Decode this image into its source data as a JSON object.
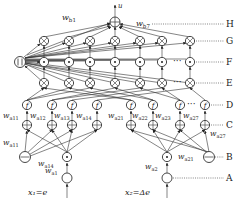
{
  "diagram": {
    "output_label": "u",
    "input_labels": {
      "x1": "x₁=e",
      "x2": "x₂=Δe"
    },
    "row_labels": [
      "H",
      "G",
      "F",
      "E",
      "D",
      "C",
      "B",
      "A"
    ],
    "weight_labels": {
      "wb1": "w_b1",
      "wb7": "w_b7",
      "wa11": "w_a11",
      "wa12": "w_a12",
      "wa13": "w_a13",
      "wa14": "w_a14",
      "wa21": "w_a21",
      "wa22": "w_a22",
      "wa23": "w_a23",
      "wa27": "w_a27",
      "wa11_b": "w_a11",
      "wa14_b": "w_a14",
      "wa1": "w_a1",
      "wa2": "w_a2",
      "wa21_b": "w_a21",
      "wa27_b": "w_a27"
    },
    "node_symbols": {
      "sum": "⊕",
      "product": "⊗",
      "dot": "⊙",
      "function": "f",
      "pi": "Π",
      "minus": "⊖",
      "input": "○"
    },
    "ellipsis": "···",
    "colors": {
      "stroke": "#333333",
      "background": "#ffffff"
    }
  }
}
